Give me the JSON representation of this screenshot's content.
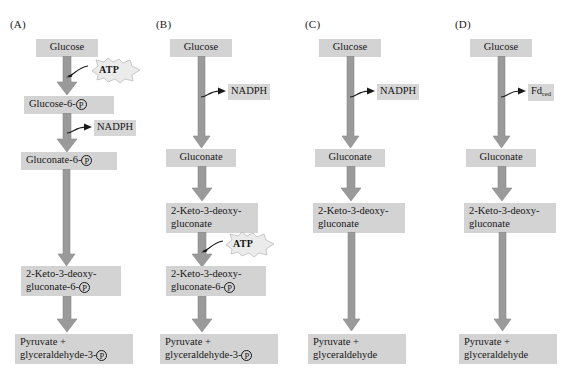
{
  "figure": {
    "type": "pathway-diagram",
    "background_color": "#ffffff",
    "node_color": "#d3d3d3",
    "arrow_color": "#9a9a9a",
    "burst_color": "#ebebeb",
    "panel_count": 4
  },
  "panels": [
    {
      "id": "A",
      "label": "(A)",
      "nodes": [
        {
          "name": "glucose",
          "line1": "Glucose"
        },
        {
          "name": "glucose-6-p",
          "line1": "Glucose-6-",
          "phosphate1": true
        },
        {
          "name": "gluconate-6-p",
          "line1": "Gluconate-6-",
          "phosphate1": true
        },
        {
          "name": "kdpg",
          "line1": "2-Keto-3-deoxy-",
          "line2": "gluconate-6-",
          "phosphate2": true
        },
        {
          "name": "pyruvate",
          "line1": "Pyruvate +",
          "line2": "glyceraldehyde-3-",
          "phosphate2": true
        }
      ],
      "cofactors": [
        {
          "name": "atp",
          "label": "ATP",
          "style": "burst"
        },
        {
          "name": "nadph",
          "label": "NADPH",
          "style": "box"
        }
      ]
    },
    {
      "id": "B",
      "label": "(B)",
      "nodes": [
        {
          "name": "glucose",
          "line1": "Glucose"
        },
        {
          "name": "gluconate",
          "line1": "Gluconate"
        },
        {
          "name": "kdg",
          "line1": "2-Keto-3-deoxy-",
          "line2": "gluconate"
        },
        {
          "name": "kdpg",
          "line1": "2-Keto-3-deoxy-",
          "line2": "gluconate-6-",
          "phosphate2": true
        },
        {
          "name": "pyruvate",
          "line1": "Pyruvate +",
          "line2": "glyceraldehyde-3-",
          "phosphate2": true
        }
      ],
      "cofactors": [
        {
          "name": "nadph",
          "label": "NADPH",
          "style": "box"
        },
        {
          "name": "atp",
          "label": "ATP",
          "style": "burst"
        }
      ]
    },
    {
      "id": "C",
      "label": "(C)",
      "nodes": [
        {
          "name": "glucose",
          "line1": "Glucose"
        },
        {
          "name": "gluconate",
          "line1": "Gluconate"
        },
        {
          "name": "kdg",
          "line1": "2-Keto-3-deoxy-",
          "line2": "gluconate"
        },
        {
          "name": "pyruvate",
          "line1": "Pyruvate +",
          "line2": "glyceraldehyde"
        }
      ],
      "cofactors": [
        {
          "name": "nadph",
          "label": "NADPH",
          "style": "box"
        }
      ]
    },
    {
      "id": "D",
      "label": "(D)",
      "nodes": [
        {
          "name": "glucose",
          "line1": "Glucose"
        },
        {
          "name": "gluconate",
          "line1": "Gluconate"
        },
        {
          "name": "kdg",
          "line1": "2-Keto-3-deoxy-",
          "line2": "gluconate"
        },
        {
          "name": "pyruvate",
          "line1": "Pyruvate +",
          "line2": "glyceraldehyde"
        }
      ],
      "cofactors": [
        {
          "name": "fd-red",
          "label": "Fd",
          "sub": "red",
          "style": "box"
        }
      ]
    }
  ],
  "text": {
    "panel_a_label": "(A)",
    "panel_b_label": "(B)",
    "panel_c_label": "(C)",
    "panel_d_label": "(D)",
    "glucose": "Glucose",
    "glucose_6_p": "Glucose-6-",
    "gluconate_6_p": "Gluconate-6-",
    "gluconate": "Gluconate",
    "kdg_line1": "2-Keto-3-deoxy-",
    "kdg_line2": "gluconate",
    "kdpg_line2": "gluconate-6-",
    "pyruvate_line1": "Pyruvate +",
    "glyceraldehyde_3_p": "glyceraldehyde-3-",
    "glyceraldehyde": "glyceraldehyde",
    "atp": "ATP",
    "nadph": "NADPH",
    "fd": "Fd",
    "fd_sub": "red",
    "p_symbol": "P"
  }
}
